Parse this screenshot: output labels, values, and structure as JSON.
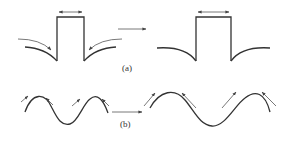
{
  "diagram": {
    "panel_a": {
      "label": "(a)",
      "description": "Rectangular protrusion with converging flow arrows transforms to smoothed profile"
    },
    "panel_b": {
      "label": "(b)",
      "description": "Sinusoidal surface with arrows at crests transforms to larger-wavelength sinusoid"
    },
    "colors": {
      "line": "#333333",
      "arrow": "#555555",
      "background": "#ffffff"
    }
  }
}
